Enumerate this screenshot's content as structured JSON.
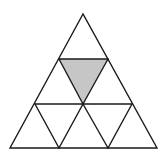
{
  "diagram": {
    "stroke_color": "#1a1a1a",
    "fill_color": "#ffffff",
    "shaded_color": "#c6c6c6",
    "stroke_width": 1.4,
    "outer_triangle": {
      "apex": [
        83,
        14
      ],
      "bottom_left": [
        10,
        148
      ],
      "bottom_right": [
        157,
        148
      ]
    },
    "horizontal_lines": [
      {
        "from": [
          59,
          59
        ],
        "to": [
          108,
          59
        ]
      },
      {
        "from": [
          35,
          104
        ],
        "to": [
          132,
          104
        ]
      }
    ],
    "inner_segments": [
      {
        "from": [
          59,
          59
        ],
        "to": [
          83,
          104
        ]
      },
      {
        "from": [
          108,
          59
        ],
        "to": [
          83,
          104
        ]
      },
      {
        "from": [
          35,
          104
        ],
        "to": [
          59,
          148
        ]
      },
      {
        "from": [
          83,
          104
        ],
        "to": [
          59,
          148
        ]
      },
      {
        "from": [
          83,
          104
        ],
        "to": [
          108,
          148
        ]
      },
      {
        "from": [
          132,
          104
        ],
        "to": [
          108,
          148
        ]
      }
    ],
    "shaded_triangle": {
      "points": [
        [
          59,
          59
        ],
        [
          108,
          59
        ],
        [
          83,
          104
        ]
      ]
    }
  }
}
